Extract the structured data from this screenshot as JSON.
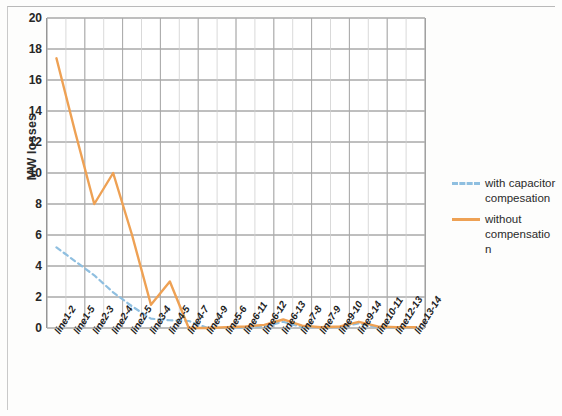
{
  "chart_data": {
    "type": "line",
    "title": "",
    "xlabel": "",
    "ylabel": "MW losses",
    "ylim": [
      0,
      20
    ],
    "ytick_step": 2,
    "yticks": [
      20,
      18,
      16,
      14,
      12,
      10,
      8,
      6,
      4,
      2,
      0
    ],
    "grid": true,
    "legend_position": "right",
    "categories": [
      "line1-2",
      "line1-5",
      "line2-3",
      "line2-4",
      "line2-5",
      "line3-4",
      "line4-5",
      "line4-7",
      "line4-9",
      "line5-6",
      "line6-11",
      "line6-12",
      "line6-13",
      "line7-8",
      "line7-9",
      "line9-10",
      "line9-14",
      "line10-11",
      "line12-13",
      "line13-14"
    ],
    "series": [
      {
        "name": "with capacitor compesation",
        "style": "dashed",
        "color": "#8fbfe0",
        "values": [
          5.2,
          4.3,
          3.4,
          2.3,
          1.4,
          0.6,
          0.5,
          0.45,
          0.0,
          0.0,
          0.05,
          0.1,
          0.4,
          0.05,
          0.05,
          0.05,
          0.3,
          0.05,
          0.0,
          0.0
        ]
      },
      {
        "name": "without compensation",
        "style": "solid",
        "color": "#eea154",
        "values": [
          17.4,
          12.6,
          8.0,
          10.0,
          6.0,
          1.5,
          3.0,
          0.0,
          0.0,
          0.05,
          0.1,
          0.2,
          0.55,
          0.15,
          0.05,
          0.1,
          0.4,
          0.1,
          0.05,
          0.05
        ]
      }
    ]
  },
  "legend": {
    "entries": [
      {
        "label": "with capacitor compesation",
        "style": "dashed",
        "color": "#8fbfe0"
      },
      {
        "label": "without compensatio n",
        "style": "solid",
        "color": "#eea154"
      }
    ]
  },
  "axes": {
    "y_title": "MW losses"
  },
  "colors": {
    "series_with_compensation": "#8fbfe0",
    "series_without_compensation": "#eea154",
    "gridline": "#6f6f6f",
    "minor_gridline": "#cfcfcf"
  }
}
